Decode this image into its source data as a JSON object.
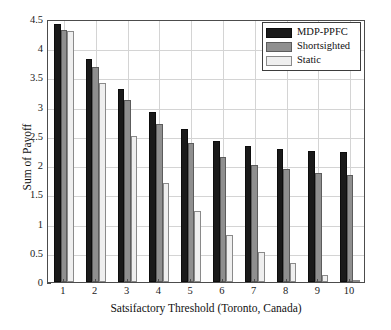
{
  "chart_data": {
    "type": "bar",
    "title": "",
    "xlabel": "Satsifactory Threshold (Toronto, Canada)",
    "ylabel": "Sum of Payoff",
    "categories": [
      "1",
      "2",
      "3",
      "4",
      "5",
      "6",
      "7",
      "8",
      "9",
      "10"
    ],
    "series": [
      {
        "name": "MDP-PPFC",
        "color": "#1a1a1a",
        "values": [
          4.42,
          3.81,
          3.31,
          2.91,
          2.61,
          2.42,
          2.32,
          2.27,
          2.24,
          2.23
        ]
      },
      {
        "name": "Shortsighted",
        "color": "#8f8f8f",
        "values": [
          4.31,
          3.68,
          3.12,
          2.7,
          2.38,
          2.14,
          2.0,
          1.93,
          1.87,
          1.83
        ]
      },
      {
        "name": "Static",
        "color": "#efefef",
        "values": [
          4.29,
          3.41,
          2.5,
          1.7,
          1.21,
          0.81,
          0.52,
          0.32,
          0.12,
          0.04
        ]
      }
    ],
    "ylim": [
      0,
      4.5
    ],
    "yticks": [
      "0",
      "0.5",
      "1",
      "1.5",
      "2",
      "2.5",
      "3",
      "3.5",
      "4",
      "4.5"
    ],
    "ytick_values": [
      0,
      0.5,
      1,
      1.5,
      2,
      2.5,
      3,
      3.5,
      4,
      4.5
    ],
    "grid": true,
    "legend_position": "top-right"
  },
  "legend": {
    "entries": [
      {
        "label": "MDP-PPFC"
      },
      {
        "label": "Shortsighted"
      },
      {
        "label": "Static"
      }
    ]
  },
  "page_bleed": {
    "text": ""
  }
}
